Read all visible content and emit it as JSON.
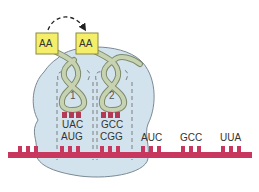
{
  "diagram": {
    "colors": {
      "ribosome_fill": "#d3e3ed",
      "ribosome_stroke": "#7a8a94",
      "trna_fill": "#c7d3b0",
      "trna_stroke": "#7e8a6c",
      "aa_fill": "#f4ee6a",
      "aa_stroke": "#8a8a3a",
      "mrna": "#c8385e",
      "anticodon_block": "#b23a55",
      "text": "#333333"
    },
    "amino_acids": [
      {
        "label": "AA",
        "position": "left"
      },
      {
        "label": "AA",
        "position": "right"
      }
    ],
    "transfer_arrow": "dashed-curved-arrow-left-to-right",
    "trnas": [
      {
        "number": "1",
        "anticodon": "UAC",
        "codon": "AUG"
      },
      {
        "number": "2",
        "anticodon": "GCC",
        "codon": "CGG"
      }
    ],
    "downstream_codons": [
      "AUC",
      "GCC",
      "UUA"
    ]
  }
}
